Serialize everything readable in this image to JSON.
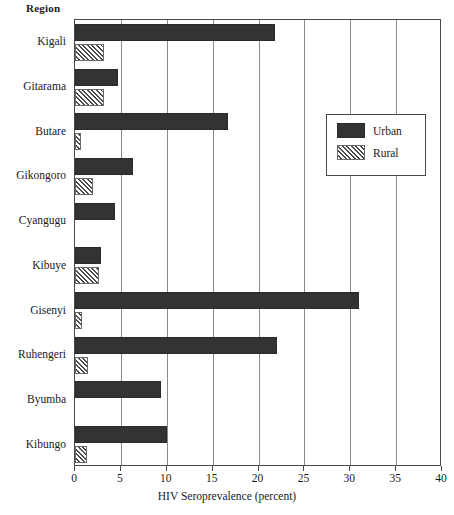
{
  "axis_header": "Region",
  "legend": {
    "position": "upper-right-inside",
    "entries": [
      {
        "label": "Urban",
        "swatch": "solid-dark-swatch"
      },
      {
        "label": "Rural",
        "swatch": "hatched-swatch"
      }
    ]
  },
  "chart_data": {
    "type": "bar",
    "orientation": "horizontal",
    "title": "",
    "xlabel": "HIV Seroprevalence (percent)",
    "ylabel": "Region",
    "xlim": [
      0,
      40
    ],
    "xticks": [
      0,
      5,
      10,
      15,
      20,
      25,
      30,
      35,
      40
    ],
    "xtick_labels": [
      "0",
      "5",
      "10",
      "15",
      "20",
      "25",
      "30",
      "35",
      "40"
    ],
    "grid": "vertical",
    "categories": [
      "Kigali",
      "Gitarama",
      "Butare",
      "Gikongoro",
      "Cyangugu",
      "Kibuye",
      "Gisenyi",
      "Ruhengeri",
      "Byumba",
      "Kibungo"
    ],
    "series": [
      {
        "name": "Urban",
        "color": "#333333",
        "values": [
          21.8,
          4.7,
          16.7,
          6.3,
          4.4,
          2.8,
          31.0,
          22.0,
          9.4,
          10.0
        ]
      },
      {
        "name": "Rural",
        "color": "#ffffff",
        "hatch": "///",
        "values": [
          3.2,
          3.2,
          0.7,
          2.0,
          0.0,
          2.6,
          0.8,
          1.4,
          0.0,
          1.3
        ]
      }
    ]
  }
}
